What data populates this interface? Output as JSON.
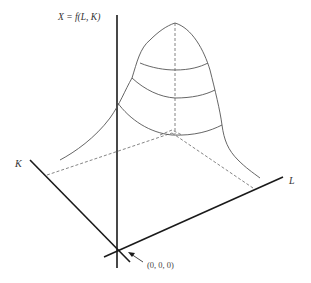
{
  "diagram": {
    "labels": {
      "vertical_axis": "X = f(L, K)",
      "k_axis": "K",
      "l_axis": "L",
      "origin": "(0, 0, 0)"
    },
    "colors": {
      "axis": "#1a1a1a",
      "surface": "#555555",
      "dashed": "#666666",
      "text": "#333333"
    }
  }
}
